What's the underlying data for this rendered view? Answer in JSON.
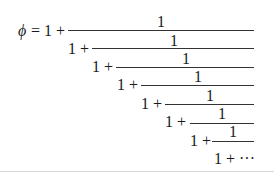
{
  "formula": {
    "lhs_symbol": "ϕ",
    "equals": "=",
    "lead": "1 +",
    "numerator": "1",
    "levels": [
      {
        "prefix": "1 +",
        "numerator": "1"
      },
      {
        "prefix": "1 +",
        "numerator": "1"
      },
      {
        "prefix": "1 +",
        "numerator": "1"
      },
      {
        "prefix": "1 +",
        "numerator": "1"
      },
      {
        "prefix": "1 +",
        "numerator": "1"
      },
      {
        "prefix": "1 +",
        "numerator": "1"
      }
    ],
    "tail": "1 + ···"
  }
}
